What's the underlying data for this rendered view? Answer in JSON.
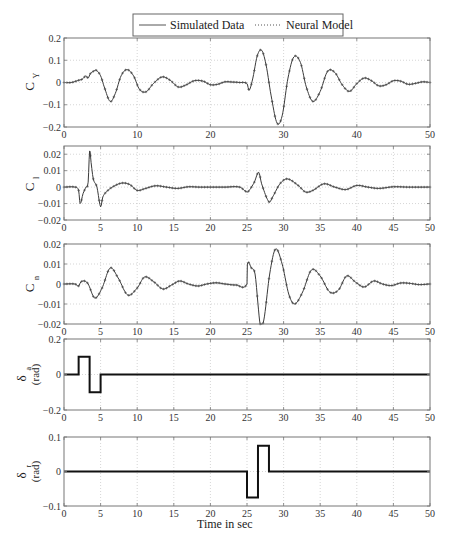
{
  "chart_data": {
    "type": "line",
    "legend": {
      "placement": "top-center",
      "entries": [
        {
          "name": "Simulated Data",
          "style": "solid"
        },
        {
          "name": "Neural Model",
          "style": "dotted-marker"
        }
      ]
    },
    "xlabel": "Time in sec",
    "colors": {
      "line": "#3a3a3a",
      "frame": "#777777",
      "grid": "#bbbbbb",
      "input": "#111111"
    },
    "panels": [
      {
        "id": "cy",
        "ylabel": "C",
        "ylabel_sub": "Y",
        "ylabel_unit": "",
        "ylim": [
          -0.2,
          0.2
        ],
        "yticks": [
          -0.2,
          -0.1,
          0,
          0.1,
          0.2
        ],
        "yticklabels": [
          "-0.2",
          "-0.1",
          "0",
          "0.1",
          "0.2"
        ],
        "xlim": [
          0,
          50
        ],
        "xticks": [
          0,
          10,
          20,
          30,
          40,
          50
        ],
        "xticklabels": [
          "0",
          "10",
          "20",
          "30",
          "40",
          "50"
        ],
        "grid": true,
        "kind": "response",
        "series": {
          "x": [
            0,
            1,
            2,
            2.5,
            3,
            3.3,
            3.6,
            4,
            4.4,
            5,
            5.5,
            6.3,
            7,
            7.8,
            8.6,
            9.5,
            10.3,
            11.2,
            12.2,
            13.4,
            14.5,
            15.6,
            16.6,
            17.8,
            19,
            20,
            21,
            22,
            23,
            24,
            25,
            25.3,
            25.8,
            26.4,
            27,
            27.6,
            28.3,
            29.1,
            29.8,
            30.6,
            31.4,
            32.3,
            33.1,
            34,
            35,
            36,
            37,
            38,
            39,
            40,
            41,
            42,
            43,
            44,
            45,
            46,
            47,
            48,
            49,
            50
          ],
          "y": [
            0,
            0,
            0.01,
            0.015,
            0.03,
            0.02,
            0.04,
            0.05,
            0.055,
            0.03,
            -0.02,
            -0.085,
            -0.05,
            0.03,
            0.058,
            0.03,
            -0.03,
            -0.042,
            -0.005,
            0.025,
            0.01,
            -0.02,
            -0.012,
            0.008,
            0.006,
            -0.01,
            -0.008,
            0.003,
            0.002,
            0.0,
            -0.005,
            -0.035,
            0.02,
            0.12,
            0.145,
            0.08,
            -0.06,
            -0.182,
            -0.15,
            0.02,
            0.115,
            0.09,
            -0.02,
            -0.085,
            -0.04,
            0.05,
            0.045,
            -0.01,
            -0.04,
            -0.005,
            0.02,
            0.008,
            -0.015,
            -0.01,
            0.008,
            0.006,
            -0.008,
            -0.004,
            0.003,
            0.0
          ]
        }
      },
      {
        "id": "cl",
        "ylabel": "C",
        "ylabel_sub": "l",
        "ylabel_unit": "",
        "ylim": [
          -0.02,
          0.025
        ],
        "yticks": [
          -0.02,
          -0.01,
          0,
          0.01,
          0.02
        ],
        "yticklabels": [
          "-0.02",
          "-0.01",
          "0",
          "0.01",
          "0.02"
        ],
        "xlim": [
          0,
          50
        ],
        "xticks": [
          0,
          5,
          10,
          15,
          20,
          25,
          30,
          35,
          40,
          45,
          50
        ],
        "xticklabels": [
          "0",
          "5",
          "10",
          "15",
          "20",
          "25",
          "30",
          "35",
          "40",
          "45",
          "50"
        ],
        "grid": true,
        "kind": "response",
        "series": {
          "x": [
            0,
            1.5,
            2,
            2.2,
            2.6,
            3,
            3.3,
            3.5,
            3.7,
            4,
            4.5,
            5,
            5.3,
            6,
            7,
            8,
            9,
            10,
            11,
            12.5,
            14,
            15.5,
            17,
            18.5,
            20,
            22,
            24,
            25,
            25.3,
            26,
            26.6,
            27,
            28,
            28.5,
            29.5,
            30.5,
            32,
            33,
            34,
            35.5,
            37,
            38.5,
            40,
            41.5,
            43,
            45,
            47,
            50
          ],
          "y": [
            0,
            0,
            -0.002,
            -0.01,
            -0.004,
            0.0,
            0.003,
            0.022,
            0.015,
            0.005,
            0.0,
            -0.012,
            -0.006,
            -0.002,
            0.001,
            0.0025,
            0.0015,
            -0.002,
            -0.001,
            0.0008,
            0.0,
            -0.0008,
            0.0002,
            0.0,
            0.0,
            0.0,
            0.0,
            -0.003,
            -0.002,
            0.003,
            0.009,
            0.002,
            -0.009,
            -0.006,
            0.002,
            0.005,
            0.001,
            -0.003,
            -0.002,
            0.002,
            0.0,
            -0.0015,
            0.001,
            0.0,
            -0.0008,
            0.0002,
            0.0,
            0.0
          ]
        }
      },
      {
        "id": "cn",
        "ylabel": "C",
        "ylabel_sub": "n",
        "ylabel_unit": "",
        "ylim": [
          -0.02,
          0.02
        ],
        "yticks": [
          -0.02,
          -0.01,
          0,
          0.01,
          0.02
        ],
        "yticklabels": [
          "-0.02",
          "-0.01",
          "0",
          "0.01",
          "0.02"
        ],
        "xlim": [
          0,
          50
        ],
        "xticks": [
          0,
          5,
          10,
          15,
          20,
          25,
          30,
          35,
          40,
          45,
          50
        ],
        "xticklabels": [
          "0",
          "5",
          "10",
          "15",
          "20",
          "25",
          "30",
          "35",
          "40",
          "45",
          "50"
        ],
        "grid": true,
        "kind": "response",
        "series": {
          "x": [
            0,
            1.5,
            2,
            2.3,
            2.8,
            3.3,
            4.2,
            5.2,
            6.3,
            7.4,
            8.7,
            10,
            11,
            12.3,
            13.5,
            14.7,
            15.8,
            17,
            18.3,
            19.5,
            20.8,
            22,
            23.5,
            25,
            25.05,
            25.6,
            26.1,
            26.5,
            26.8,
            27.3,
            28.1,
            28.9,
            29.8,
            30.7,
            31.5,
            32.6,
            33.8,
            35,
            36.3,
            37.5,
            38.6,
            39.8,
            41,
            42.3,
            43.5,
            44.7,
            46,
            47.3,
            48.5,
            50
          ],
          "y": [
            0,
            0,
            -0.001,
            0.001,
            0.0015,
            0.0,
            -0.007,
            -0.002,
            0.008,
            0.003,
            -0.0055,
            -0.002,
            0.0035,
            0.001,
            -0.0025,
            -0.0005,
            0.0015,
            0.0,
            -0.001,
            0.0,
            0.0006,
            0.0,
            -0.0005,
            0.0,
            0.01,
            0.008,
            0.005,
            -0.01,
            -0.02,
            -0.018,
            0.005,
            0.0175,
            0.01,
            -0.005,
            -0.01,
            -0.004,
            0.007,
            0.004,
            -0.004,
            -0.003,
            0.004,
            0.001,
            -0.0015,
            0.0015,
            0.0,
            -0.0008,
            0.0005,
            0.0003,
            -0.0003,
            0.0
          ]
        }
      },
      {
        "id": "da",
        "ylabel": "δ",
        "ylabel_sub": "a",
        "ylabel_unit": "(rad)",
        "ylim": [
          -0.2,
          0.2
        ],
        "yticks": [
          -0.2,
          0,
          0.2
        ],
        "yticklabels": [
          "-0.2",
          "0",
          "0.2"
        ],
        "xlim": [
          0,
          50
        ],
        "xticks": [
          0,
          5,
          10,
          15,
          20,
          25,
          30,
          35,
          40,
          45,
          50
        ],
        "xticklabels": [
          "0",
          "5",
          "10",
          "15",
          "20",
          "25",
          "30",
          "35",
          "40",
          "45",
          "50"
        ],
        "grid": true,
        "kind": "input",
        "series": {
          "x": [
            0,
            2,
            2,
            3.5,
            3.5,
            5,
            5,
            50
          ],
          "y": [
            0,
            0,
            0.1,
            0.1,
            -0.1,
            -0.1,
            0,
            0
          ]
        }
      },
      {
        "id": "dr",
        "ylabel": "δ",
        "ylabel_sub": "r",
        "ylabel_unit": "(rad)",
        "ylim": [
          -0.1,
          0.1
        ],
        "yticks": [
          -0.1,
          0,
          0.1
        ],
        "yticklabels": [
          "-0.1",
          "0",
          "0.1"
        ],
        "xlim": [
          0,
          50
        ],
        "xticks": [
          0,
          5,
          10,
          15,
          20,
          25,
          30,
          35,
          40,
          45,
          50
        ],
        "xticklabels": [
          "0",
          "5",
          "10",
          "15",
          "20",
          "25",
          "30",
          "35",
          "40",
          "45",
          "50"
        ],
        "grid": true,
        "kind": "input",
        "series": {
          "x": [
            0,
            25,
            25,
            26.5,
            26.5,
            28,
            28,
            50
          ],
          "y": [
            0,
            0,
            -0.075,
            -0.075,
            0.075,
            0.075,
            0,
            0
          ]
        }
      }
    ]
  }
}
